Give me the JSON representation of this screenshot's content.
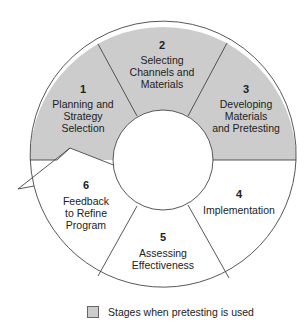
{
  "diagram": {
    "type": "cycle",
    "center": [
      163,
      160
    ],
    "outer_radius": 133,
    "inner_radius": 50,
    "colors": {
      "pretest_fill": "#cccccc",
      "normal_fill": "#ffffff",
      "stroke": "#444444"
    },
    "stages": [
      {
        "number": "1",
        "lines": [
          "Planning and",
          "Strategy",
          "Selection"
        ],
        "pretesting": true
      },
      {
        "number": "2",
        "lines": [
          "Selecting",
          "Channels and",
          "Materials"
        ],
        "pretesting": true
      },
      {
        "number": "3",
        "lines": [
          "Developing",
          "Materials",
          "and Pretesting"
        ],
        "pretesting": true
      },
      {
        "number": "4",
        "lines": [
          "Implementation"
        ],
        "pretesting": false
      },
      {
        "number": "5",
        "lines": [
          "Assessing",
          "Effectiveness"
        ],
        "pretesting": false
      },
      {
        "number": "6",
        "lines": [
          "Feedback",
          "to Refine",
          "Program"
        ],
        "pretesting": false
      }
    ]
  },
  "legend": {
    "label": "Stages when pretesting is used",
    "swatch_color": "#cccccc"
  }
}
